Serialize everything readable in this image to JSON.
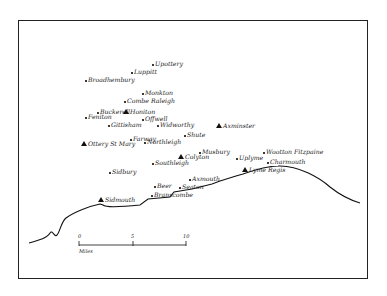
{
  "map": {
    "places": [
      {
        "name": "Upottery",
        "x": 153,
        "y": 65,
        "type": "village"
      },
      {
        "name": "Luppitt",
        "x": 132,
        "y": 73,
        "type": "village"
      },
      {
        "name": "Broadhembury",
        "x": 86,
        "y": 81,
        "type": "village"
      },
      {
        "name": "Monkton",
        "x": 143,
        "y": 94,
        "type": "village"
      },
      {
        "name": "Combe Raleigh",
        "x": 125,
        "y": 102,
        "type": "village"
      },
      {
        "name": "Buckerell",
        "x": 98,
        "y": 113,
        "type": "village"
      },
      {
        "name": "Honiton",
        "x": 126,
        "y": 113,
        "type": "town"
      },
      {
        "name": "Feniton",
        "x": 86,
        "y": 118,
        "type": "village"
      },
      {
        "name": "Offwell",
        "x": 143,
        "y": 120,
        "type": "village"
      },
      {
        "name": "Gittisham",
        "x": 109,
        "y": 126,
        "type": "village"
      },
      {
        "name": "Widworthy",
        "x": 158,
        "y": 126,
        "type": "village"
      },
      {
        "name": "Axminster",
        "x": 219,
        "y": 127,
        "type": "town"
      },
      {
        "name": "Shute",
        "x": 185,
        "y": 136,
        "type": "village"
      },
      {
        "name": "Farway",
        "x": 131,
        "y": 140,
        "type": "village"
      },
      {
        "name": "Northleigh",
        "x": 145,
        "y": 143,
        "type": "village"
      },
      {
        "name": "Ottery St Mary",
        "x": 84,
        "y": 145,
        "type": "town"
      },
      {
        "name": "Musbury",
        "x": 200,
        "y": 153,
        "type": "village"
      },
      {
        "name": "Wootton Fitzpaine",
        "x": 264,
        "y": 153,
        "type": "village"
      },
      {
        "name": "Colyton",
        "x": 181,
        "y": 158,
        "type": "town"
      },
      {
        "name": "Uplyme",
        "x": 237,
        "y": 159,
        "type": "village"
      },
      {
        "name": "Charmouth",
        "x": 268,
        "y": 163,
        "type": "village"
      },
      {
        "name": "Southleigh",
        "x": 153,
        "y": 164,
        "type": "village"
      },
      {
        "name": "Sidbury",
        "x": 110,
        "y": 173,
        "type": "village"
      },
      {
        "name": "Lyme Regis",
        "x": 245,
        "y": 171,
        "type": "town"
      },
      {
        "name": "Axmouth",
        "x": 190,
        "y": 180,
        "type": "village"
      },
      {
        "name": "Beer",
        "x": 155,
        "y": 187,
        "type": "village"
      },
      {
        "name": "Seaton",
        "x": 180,
        "y": 188,
        "type": "village"
      },
      {
        "name": "Branscombe",
        "x": 152,
        "y": 196,
        "type": "village"
      },
      {
        "name": "Sidmouth",
        "x": 101,
        "y": 201,
        "type": "town"
      }
    ],
    "scale": {
      "ticks": [
        "0",
        "5",
        "10"
      ],
      "unit": "Miles"
    },
    "colors": {
      "ink": "#111111",
      "background": "#ffffff"
    }
  }
}
